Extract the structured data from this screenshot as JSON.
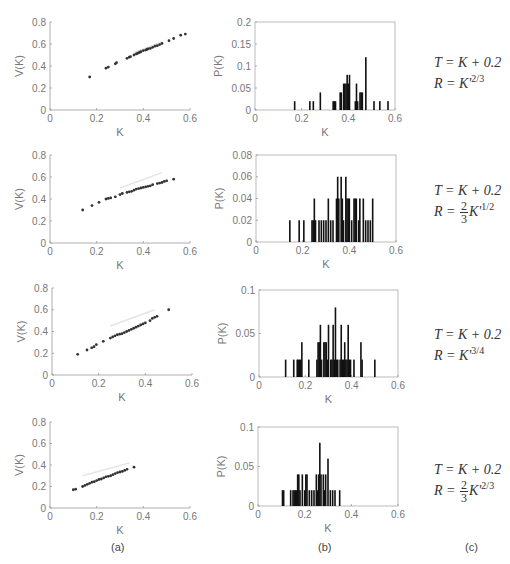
{
  "panel_labels": [
    "(a)",
    "(b)",
    "(c)"
  ],
  "formulas": [
    {
      "t": "T = K + 0.2",
      "r_prefix": "R = ",
      "frac": null,
      "base": "K'",
      "exp_num": "2",
      "exp_den": "3"
    },
    {
      "t": "T = K + 0.2",
      "r_prefix": "R = ",
      "frac": {
        "num": "2",
        "den": "3"
      },
      "base": "K'",
      "exp_num": "1",
      "exp_den": "2"
    },
    {
      "t": "T = K + 0.2",
      "r_prefix": "R = ",
      "frac": null,
      "base": "K'",
      "exp_num": "3",
      "exp_den": "4"
    },
    {
      "t": "T = K + 0.2",
      "r_prefix": "R = ",
      "frac": {
        "num": "2",
        "den": "3"
      },
      "base": "K'",
      "exp_num": "2",
      "exp_den": "3"
    }
  ],
  "chart_data": [
    {
      "type": "scatter",
      "panel": "a",
      "row": 1,
      "xlabel": "K",
      "ylabel": "V(K)",
      "xlim": [
        0,
        0.6
      ],
      "ylim": [
        0,
        0.8
      ],
      "xticks": [
        "0",
        "0.2",
        "0.4",
        "0.6"
      ],
      "yticks": [
        "0",
        "0.2",
        "0.4",
        "0.6",
        "0.8"
      ],
      "box": {
        "x0": 50,
        "y0": 22,
        "x1": 190,
        "y1": 110
      },
      "points": [
        [
          0.17,
          0.3
        ],
        [
          0.24,
          0.38
        ],
        [
          0.25,
          0.39
        ],
        [
          0.28,
          0.42
        ],
        [
          0.285,
          0.43
        ],
        [
          0.33,
          0.47
        ],
        [
          0.34,
          0.48
        ],
        [
          0.345,
          0.485
        ],
        [
          0.36,
          0.5
        ],
        [
          0.37,
          0.51
        ],
        [
          0.375,
          0.515
        ],
        [
          0.38,
          0.52
        ],
        [
          0.385,
          0.525
        ],
        [
          0.39,
          0.53
        ],
        [
          0.4,
          0.54
        ],
        [
          0.41,
          0.545
        ],
        [
          0.415,
          0.55
        ],
        [
          0.42,
          0.555
        ],
        [
          0.43,
          0.56
        ],
        [
          0.44,
          0.57
        ],
        [
          0.45,
          0.58
        ],
        [
          0.46,
          0.585
        ],
        [
          0.47,
          0.595
        ],
        [
          0.48,
          0.605
        ],
        [
          0.51,
          0.63
        ],
        [
          0.53,
          0.65
        ],
        [
          0.56,
          0.68
        ],
        [
          0.58,
          0.69
        ]
      ],
      "faint_line": [
        [
          0.36,
          0.52
        ],
        [
          0.48,
          0.62
        ]
      ]
    },
    {
      "type": "bar",
      "panel": "b",
      "row": 1,
      "xlabel": "K",
      "ylabel": "P(K)",
      "xlim": [
        0,
        0.6
      ],
      "ylim": [
        0,
        0.2
      ],
      "xticks": [
        "0",
        "0.2",
        "0.4",
        "0.6"
      ],
      "yticks": [
        "0",
        "0.05",
        "0.1",
        "0.15",
        "0.2"
      ],
      "box": {
        "x0": 255,
        "y0": 22,
        "x1": 395,
        "y1": 110
      },
      "bar_width": 0.005,
      "bars": [
        [
          0.17,
          0.02
        ],
        [
          0.235,
          0.02
        ],
        [
          0.25,
          0.02
        ],
        [
          0.28,
          0.04
        ],
        [
          0.335,
          0.02
        ],
        [
          0.34,
          0.02
        ],
        [
          0.345,
          0.02
        ],
        [
          0.365,
          0.04
        ],
        [
          0.37,
          0.04
        ],
        [
          0.38,
          0.06
        ],
        [
          0.385,
          0.06
        ],
        [
          0.39,
          0.06
        ],
        [
          0.395,
          0.08
        ],
        [
          0.4,
          0.06
        ],
        [
          0.405,
          0.08
        ],
        [
          0.43,
          0.02
        ],
        [
          0.435,
          0.06
        ],
        [
          0.44,
          0.02
        ],
        [
          0.45,
          0.04
        ],
        [
          0.455,
          0.04
        ],
        [
          0.46,
          0.04
        ],
        [
          0.475,
          0.12
        ],
        [
          0.51,
          0.02
        ],
        [
          0.535,
          0.02
        ],
        [
          0.57,
          0.02
        ]
      ]
    },
    {
      "type": "scatter",
      "panel": "a",
      "row": 2,
      "xlabel": "K",
      "ylabel": "V(K)",
      "xlim": [
        0,
        0.6
      ],
      "ylim": [
        0,
        0.8
      ],
      "xticks": [
        "0",
        "0.2",
        "0.4",
        "0.6"
      ],
      "yticks": [
        "0",
        "0.2",
        "0.4",
        "0.6",
        "0.8"
      ],
      "box": {
        "x0": 50,
        "y0": 155,
        "x1": 190,
        "y1": 243
      },
      "points": [
        [
          0.14,
          0.3
        ],
        [
          0.18,
          0.34
        ],
        [
          0.21,
          0.37
        ],
        [
          0.24,
          0.4
        ],
        [
          0.25,
          0.405
        ],
        [
          0.26,
          0.41
        ],
        [
          0.28,
          0.42
        ],
        [
          0.3,
          0.44
        ],
        [
          0.31,
          0.45
        ],
        [
          0.33,
          0.46
        ],
        [
          0.34,
          0.465
        ],
        [
          0.35,
          0.47
        ],
        [
          0.36,
          0.48
        ],
        [
          0.37,
          0.49
        ],
        [
          0.38,
          0.495
        ],
        [
          0.39,
          0.5
        ],
        [
          0.4,
          0.505
        ],
        [
          0.41,
          0.51
        ],
        [
          0.42,
          0.515
        ],
        [
          0.43,
          0.52
        ],
        [
          0.44,
          0.53
        ],
        [
          0.46,
          0.54
        ],
        [
          0.47,
          0.545
        ],
        [
          0.48,
          0.55
        ],
        [
          0.49,
          0.56
        ],
        [
          0.5,
          0.565
        ],
        [
          0.53,
          0.58
        ]
      ],
      "faint_line": [
        [
          0.3,
          0.5
        ],
        [
          0.48,
          0.64
        ]
      ]
    },
    {
      "type": "bar",
      "panel": "b",
      "row": 2,
      "xlabel": "K",
      "ylabel": "P(K)",
      "xlim": [
        0,
        0.6
      ],
      "ylim": [
        0,
        0.08
      ],
      "xticks": [
        "0",
        "0.2",
        "0.4",
        "0.6"
      ],
      "yticks": [
        "0",
        "0.02",
        "0.04",
        "0.06",
        "0.08"
      ],
      "box": {
        "x0": 256,
        "y0": 155,
        "x1": 396,
        "y1": 242
      },
      "bar_width": 0.005,
      "bars": [
        [
          0.145,
          0.02
        ],
        [
          0.185,
          0.02
        ],
        [
          0.205,
          0.02
        ],
        [
          0.24,
          0.02
        ],
        [
          0.245,
          0.02
        ],
        [
          0.25,
          0.04
        ],
        [
          0.255,
          0.02
        ],
        [
          0.27,
          0.02
        ],
        [
          0.28,
          0.02
        ],
        [
          0.29,
          0.02
        ],
        [
          0.3,
          0.02
        ],
        [
          0.31,
          0.04
        ],
        [
          0.32,
          0.02
        ],
        [
          0.33,
          0.02
        ],
        [
          0.345,
          0.04
        ],
        [
          0.35,
          0.06
        ],
        [
          0.355,
          0.04
        ],
        [
          0.365,
          0.06
        ],
        [
          0.37,
          0.04
        ],
        [
          0.375,
          0.02
        ],
        [
          0.385,
          0.06
        ],
        [
          0.39,
          0.04
        ],
        [
          0.395,
          0.04
        ],
        [
          0.4,
          0.04
        ],
        [
          0.41,
          0.02
        ],
        [
          0.42,
          0.04
        ],
        [
          0.425,
          0.04
        ],
        [
          0.43,
          0.04
        ],
        [
          0.44,
          0.02
        ],
        [
          0.445,
          0.04
        ],
        [
          0.46,
          0.04
        ],
        [
          0.47,
          0.02
        ],
        [
          0.48,
          0.02
        ],
        [
          0.49,
          0.02
        ],
        [
          0.5,
          0.04
        ]
      ]
    },
    {
      "type": "scatter",
      "panel": "a",
      "row": 3,
      "xlabel": "K",
      "ylabel": "V(K)",
      "xlim": [
        0,
        0.6
      ],
      "ylim": [
        0,
        0.8
      ],
      "xticks": [
        "0",
        "0.2",
        "0.4",
        "0.6"
      ],
      "yticks": [
        "0",
        "0.2",
        "0.4",
        "0.6",
        "0.8"
      ],
      "box": {
        "x0": 52,
        "y0": 288,
        "x1": 192,
        "y1": 375
      },
      "points": [
        [
          0.11,
          0.19
        ],
        [
          0.15,
          0.23
        ],
        [
          0.17,
          0.25
        ],
        [
          0.18,
          0.26
        ],
        [
          0.19,
          0.28
        ],
        [
          0.22,
          0.31
        ],
        [
          0.25,
          0.34
        ],
        [
          0.26,
          0.35
        ],
        [
          0.27,
          0.36
        ],
        [
          0.28,
          0.37
        ],
        [
          0.29,
          0.375
        ],
        [
          0.3,
          0.38
        ],
        [
          0.31,
          0.39
        ],
        [
          0.32,
          0.4
        ],
        [
          0.33,
          0.41
        ],
        [
          0.34,
          0.42
        ],
        [
          0.35,
          0.43
        ],
        [
          0.36,
          0.44
        ],
        [
          0.37,
          0.45
        ],
        [
          0.38,
          0.46
        ],
        [
          0.39,
          0.47
        ],
        [
          0.4,
          0.48
        ],
        [
          0.42,
          0.5
        ],
        [
          0.43,
          0.52
        ],
        [
          0.44,
          0.53
        ],
        [
          0.45,
          0.54
        ],
        [
          0.5,
          0.6
        ]
      ],
      "faint_line": [
        [
          0.25,
          0.45
        ],
        [
          0.44,
          0.6
        ]
      ]
    },
    {
      "type": "bar",
      "panel": "b",
      "row": 3,
      "xlabel": "K",
      "ylabel": "P(K)",
      "xlim": [
        0,
        0.6
      ],
      "ylim": [
        0,
        0.1
      ],
      "xticks": [
        "0",
        "0.2",
        "0.4",
        "0.6"
      ],
      "yticks": [
        "0",
        "0.05",
        "0.1"
      ],
      "box": {
        "x0": 259,
        "y0": 290,
        "x1": 398,
        "y1": 377
      },
      "bar_width": 0.005,
      "bars": [
        [
          0.115,
          0.02
        ],
        [
          0.15,
          0.02
        ],
        [
          0.165,
          0.02
        ],
        [
          0.17,
          0.02
        ],
        [
          0.175,
          0.02
        ],
        [
          0.18,
          0.02
        ],
        [
          0.185,
          0.04
        ],
        [
          0.215,
          0.02
        ],
        [
          0.25,
          0.02
        ],
        [
          0.255,
          0.04
        ],
        [
          0.26,
          0.04
        ],
        [
          0.265,
          0.06
        ],
        [
          0.27,
          0.02
        ],
        [
          0.28,
          0.04
        ],
        [
          0.285,
          0.04
        ],
        [
          0.29,
          0.04
        ],
        [
          0.295,
          0.02
        ],
        [
          0.3,
          0.06
        ],
        [
          0.31,
          0.02
        ],
        [
          0.315,
          0.02
        ],
        [
          0.32,
          0.06
        ],
        [
          0.325,
          0.02
        ],
        [
          0.33,
          0.08
        ],
        [
          0.335,
          0.02
        ],
        [
          0.34,
          0.02
        ],
        [
          0.35,
          0.02
        ],
        [
          0.355,
          0.06
        ],
        [
          0.36,
          0.02
        ],
        [
          0.365,
          0.02
        ],
        [
          0.37,
          0.04
        ],
        [
          0.375,
          0.02
        ],
        [
          0.38,
          0.02
        ],
        [
          0.385,
          0.06
        ],
        [
          0.39,
          0.02
        ],
        [
          0.395,
          0.02
        ],
        [
          0.41,
          0.02
        ],
        [
          0.44,
          0.04
        ],
        [
          0.445,
          0.02
        ],
        [
          0.5,
          0.02
        ]
      ]
    },
    {
      "type": "scatter",
      "panel": "a",
      "row": 4,
      "xlabel": "K",
      "ylabel": "V(K)",
      "xlim": [
        0,
        0.6
      ],
      "ylim": [
        0,
        0.8
      ],
      "xticks": [
        "0",
        "0.2",
        "0.4",
        "0.6"
      ],
      "yticks": [
        "0",
        "0.2",
        "0.4",
        "0.6",
        "0.8"
      ],
      "box": {
        "x0": 50,
        "y0": 422,
        "x1": 190,
        "y1": 508
      },
      "points": [
        [
          0.1,
          0.17
        ],
        [
          0.11,
          0.175
        ],
        [
          0.14,
          0.2
        ],
        [
          0.15,
          0.21
        ],
        [
          0.16,
          0.22
        ],
        [
          0.17,
          0.23
        ],
        [
          0.18,
          0.24
        ],
        [
          0.19,
          0.245
        ],
        [
          0.2,
          0.255
        ],
        [
          0.21,
          0.265
        ],
        [
          0.22,
          0.27
        ],
        [
          0.23,
          0.28
        ],
        [
          0.24,
          0.29
        ],
        [
          0.25,
          0.295
        ],
        [
          0.26,
          0.3
        ],
        [
          0.27,
          0.31
        ],
        [
          0.28,
          0.32
        ],
        [
          0.29,
          0.33
        ],
        [
          0.3,
          0.335
        ],
        [
          0.31,
          0.34
        ],
        [
          0.32,
          0.35
        ],
        [
          0.33,
          0.36
        ],
        [
          0.36,
          0.38
        ]
      ],
      "faint_line": [
        [
          0.14,
          0.3
        ],
        [
          0.34,
          0.42
        ]
      ]
    },
    {
      "type": "bar",
      "panel": "b",
      "row": 4,
      "xlabel": "K",
      "ylabel": "P(K)",
      "xlim": [
        0,
        0.6
      ],
      "ylim": [
        0,
        0.1
      ],
      "xticks": [
        "0",
        "0.2",
        "0.4",
        "0.6"
      ],
      "yticks": [
        "0",
        "0.05",
        "0.1"
      ],
      "box": {
        "x0": 258,
        "y0": 427,
        "x1": 398,
        "y1": 506
      },
      "bar_width": 0.005,
      "bars": [
        [
          0.105,
          0.02
        ],
        [
          0.11,
          0.02
        ],
        [
          0.14,
          0.02
        ],
        [
          0.15,
          0.02
        ],
        [
          0.155,
          0.02
        ],
        [
          0.16,
          0.02
        ],
        [
          0.165,
          0.02
        ],
        [
          0.17,
          0.04
        ],
        [
          0.175,
          0.04
        ],
        [
          0.18,
          0.02
        ],
        [
          0.19,
          0.04
        ],
        [
          0.2,
          0.02
        ],
        [
          0.205,
          0.04
        ],
        [
          0.21,
          0.04
        ],
        [
          0.22,
          0.02
        ],
        [
          0.23,
          0.02
        ],
        [
          0.24,
          0.02
        ],
        [
          0.25,
          0.04
        ],
        [
          0.255,
          0.02
        ],
        [
          0.26,
          0.04
        ],
        [
          0.265,
          0.08
        ],
        [
          0.27,
          0.04
        ],
        [
          0.28,
          0.04
        ],
        [
          0.285,
          0.02
        ],
        [
          0.29,
          0.04
        ],
        [
          0.3,
          0.06
        ],
        [
          0.31,
          0.02
        ],
        [
          0.32,
          0.02
        ],
        [
          0.33,
          0.02
        ],
        [
          0.35,
          0.02
        ]
      ]
    }
  ]
}
